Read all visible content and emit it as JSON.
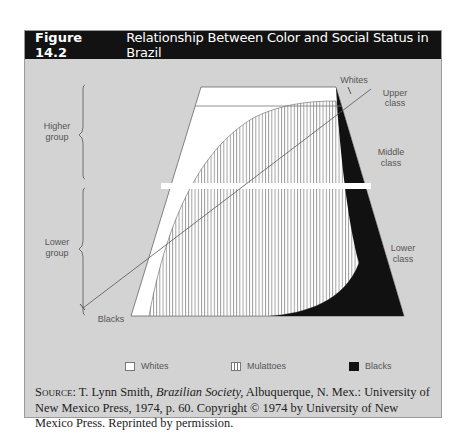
{
  "figure": {
    "number": "Figure 14.2",
    "title": "Relationship Between Color and Social Status in Brazil"
  },
  "labels": {
    "left_groups": [
      {
        "line1": "Higher",
        "line2": "group"
      },
      {
        "line1": "Lower",
        "line2": "group"
      }
    ],
    "right_classes": [
      {
        "line1": "Upper",
        "line2": "class"
      },
      {
        "line1": "Middle",
        "line2": "class"
      },
      {
        "line1": "Lower",
        "line2": "class"
      }
    ],
    "arrow_whites": "Whites",
    "arrow_blacks": "Blacks"
  },
  "legend": [
    {
      "label": "Whites",
      "swatch": "white"
    },
    {
      "label": "Mulattoes",
      "swatch": "vertical-hatch"
    },
    {
      "label": "Blacks",
      "swatch": "black"
    }
  ],
  "source": {
    "prefix": "Source:",
    "text_before": " T. Lynn Smith, ",
    "book": "Brazilian Society,",
    "text_after": " Albuquerque, N. Mex.: University of New Mexico Press, 1974, p. 60. Copyright © 1974 by University of New Mexico Press. Reprinted by permission."
  },
  "colors": {
    "header_bg": "#121212",
    "panel_bg": "#d3d3d3",
    "whites": "#ffffff",
    "blacks": "#111111",
    "hatch": "#777777"
  }
}
